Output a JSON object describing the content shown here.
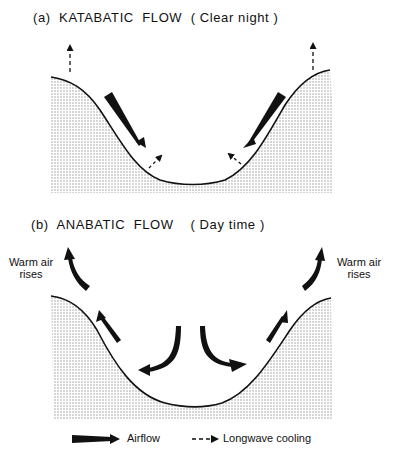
{
  "panel_a": {
    "title": "(a)  KATABATIC  FLOW  ( Clear night )",
    "arrows": {
      "airflow": "downslope toward valley floor on both sides",
      "longwave_cooling": "dashed arrows pointing upward from ridges and out of valley slopes"
    }
  },
  "panel_b": {
    "title": "(b)  ANABATIC  FLOW    ( Day time )",
    "left_label_line1": "Warm air",
    "left_label_line2": "rises",
    "right_label_line1": "Warm air",
    "right_label_line2": "rises",
    "arrows": {
      "airflow": "upslope along both sides, curving upward above ridges; central sinking air splits toward slopes"
    }
  },
  "legend": {
    "airflow_label": "Airflow",
    "longwave_label": "Longwave cooling"
  },
  "colors": {
    "ink": "#111111",
    "terrain_dots": "#9a9a9a",
    "background": "#ffffff"
  }
}
